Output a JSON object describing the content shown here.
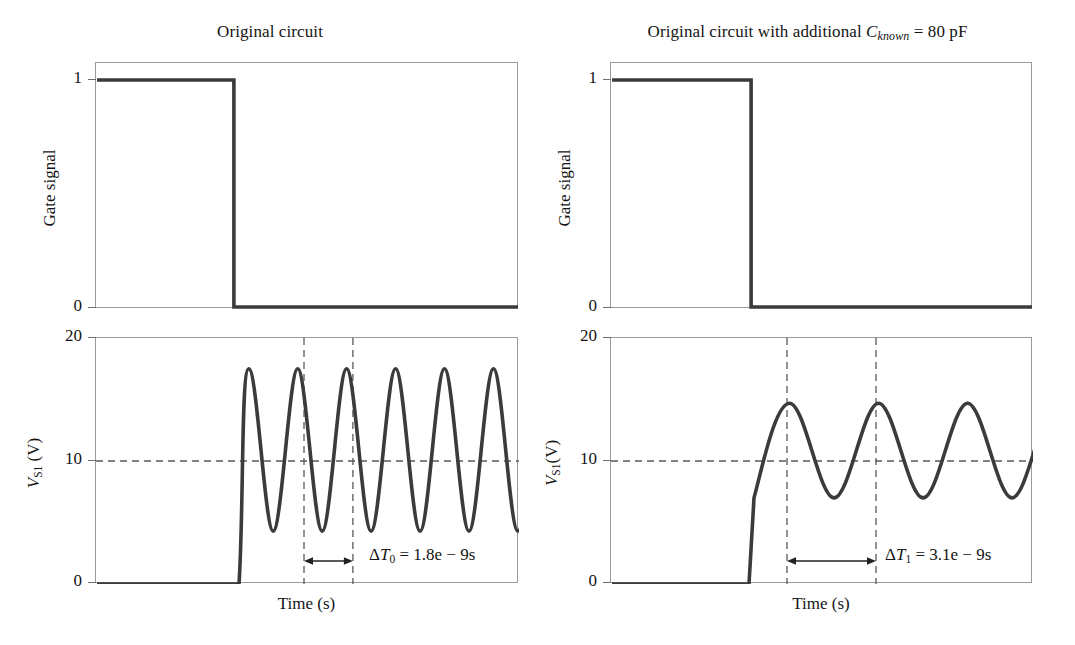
{
  "figure": {
    "background": "#ffffff",
    "line_color": "#3b3b3b",
    "frame_color": "#9a9a9a",
    "dash_color": "#5a5a5a"
  },
  "panels": [
    {
      "id": "left",
      "title_prefix": "Original circuit",
      "title_symbol": "",
      "title_subscript": "",
      "title_suffix": "",
      "top": {
        "ylabel": "Gate signal",
        "yticks": [
          "1",
          "0"
        ],
        "ylim": [
          0,
          1
        ],
        "signal": {
          "type": "gate",
          "high_value": 1,
          "low_value": 0,
          "fall_x_fraction": 0.326
        }
      },
      "bottom": {
        "ylabel_symbol": "V",
        "ylabel_subscript": "S1",
        "ylabel_unit": " (V)",
        "yticks": [
          "20",
          "10",
          "0"
        ],
        "ylim": [
          0,
          20
        ],
        "xlabel": "Time (s)",
        "threshold_line": 10,
        "signal": {
          "type": "damped-oscillation",
          "quiescent_value": 0,
          "rise_x_fraction": 0.338,
          "peak_value": 17.5,
          "trough_value": 4.3,
          "mean_value": 10.9,
          "period_x_fraction": 0.1157,
          "cycles_visible": 6
        },
        "marker_lines_x_fraction": [
          0.4917,
          0.6074
        ],
        "annotation": {
          "delta_symbol": "Δ",
          "var": "T",
          "subscript": "0",
          "equals": " = ",
          "value": "1.8e − 9s",
          "full_text": "ΔT0 = 1.8e − 9s"
        }
      }
    },
    {
      "id": "right",
      "title_prefix": "Original circuit with additional ",
      "title_symbol": "C",
      "title_subscript": "known",
      "title_suffix": " = 80 pF",
      "top": {
        "ylabel": "Gate signal",
        "yticks": [
          "1",
          "0"
        ],
        "ylim": [
          0,
          1
        ],
        "signal": {
          "type": "gate",
          "high_value": 1,
          "low_value": 0,
          "fall_x_fraction": 0.332
        }
      },
      "bottom": {
        "ylabel_symbol": "V",
        "ylabel_subscript": "S1",
        "ylabel_unit": "(V)",
        "yticks": [
          "20",
          "10",
          "0"
        ],
        "ylim": [
          0,
          20
        ],
        "xlabel": "Time (s)",
        "threshold_line": 10,
        "signal": {
          "type": "damped-oscillation",
          "quiescent_value": 0,
          "rise_x_fraction": 0.327,
          "rise_knee_value": 7.0,
          "peak_value": 14.7,
          "trough_value": 7.0,
          "mean_value": 10.85,
          "period_x_fraction": 0.2109,
          "cycles_visible": 3.5
        },
        "marker_lines_x_fraction": [
          0.4171,
          0.628
        ],
        "annotation": {
          "delta_symbol": "Δ",
          "var": "T",
          "subscript": "1",
          "equals": " = ",
          "value": "3.1e − 9s",
          "full_text": "ΔT1 = 3.1e − 9s"
        }
      }
    }
  ],
  "chart_data": {
    "type": "line",
    "subplots": [
      {
        "name": "left-gate-signal",
        "title": "Original circuit",
        "xlabel": "",
        "ylabel": "Gate signal",
        "ylim": [
          0,
          1
        ],
        "yticks": [
          0,
          1
        ],
        "grid": false,
        "series": [
          {
            "name": "Gate signal",
            "x": [
              0.0,
              0.326,
              0.326,
              1.0
            ],
            "values": [
              1,
              1,
              0,
              0
            ]
          }
        ]
      },
      {
        "name": "left-vs1",
        "title": "",
        "xlabel": "Time (s)",
        "ylabel": "V_S1 (V)",
        "ylim": [
          0,
          20
        ],
        "yticks": [
          0,
          10,
          20
        ],
        "grid": false,
        "annotations": [
          {
            "text": "ΔT0 = 1.8e − 9s",
            "x": 0.7,
            "y": 3.0
          },
          {
            "text": "threshold",
            "type": "hline",
            "y": 10
          }
        ],
        "markers_x": [
          0.4917,
          0.6074
        ],
        "series": [
          {
            "name": "V_S1 original",
            "quiescent": 0,
            "rise_x": 0.338,
            "peak": 17.5,
            "trough": 4.3,
            "period_x": 0.1157,
            "cycles": 6,
            "peaks_y": [
              17.5,
              17.5,
              17.5,
              17.5,
              17.5,
              17.5
            ],
            "troughs_y": [
              4.3,
              4.3,
              4.3,
              4.3,
              4.3
            ]
          }
        ]
      },
      {
        "name": "right-gate-signal",
        "title": "Original circuit with additional C_known = 80 pF",
        "xlabel": "",
        "ylabel": "Gate signal",
        "ylim": [
          0,
          1
        ],
        "yticks": [
          0,
          1
        ],
        "grid": false,
        "series": [
          {
            "name": "Gate signal",
            "x": [
              0.0,
              0.332,
              0.332,
              1.0
            ],
            "values": [
              1,
              1,
              0,
              0
            ]
          }
        ]
      },
      {
        "name": "right-vs1",
        "title": "",
        "xlabel": "Time (s)",
        "ylabel": "V_S1(V)",
        "ylim": [
          0,
          20
        ],
        "yticks": [
          0,
          10,
          20
        ],
        "grid": false,
        "annotations": [
          {
            "text": "ΔT1 = 3.1e − 9s",
            "x": 0.74,
            "y": 3.0
          },
          {
            "text": "threshold",
            "type": "hline",
            "y": 10
          }
        ],
        "markers_x": [
          0.4171,
          0.628
        ],
        "series": [
          {
            "name": "V_S1 with C_known",
            "quiescent": 0,
            "rise_x": 0.327,
            "rise_knee": 7.0,
            "peak": 14.7,
            "trough": 7.0,
            "period_x": 0.2109,
            "cycles": 3.5,
            "peaks_y": [
              14.7,
              14.7,
              14.7
            ],
            "troughs_y": [
              7.0,
              7.0,
              7.0
            ]
          }
        ]
      }
    ],
    "measurements": [
      {
        "label": "ΔT0",
        "value": 1.8e-09,
        "unit": "s",
        "display": "1.8e − 9s",
        "panel": "left"
      },
      {
        "label": "ΔT1",
        "value": 3.1e-09,
        "unit": "s",
        "display": "3.1e − 9s",
        "panel": "right"
      },
      {
        "label": "C_known",
        "value": 80,
        "unit": "pF",
        "display": "80 pF",
        "panel": "right"
      }
    ]
  }
}
